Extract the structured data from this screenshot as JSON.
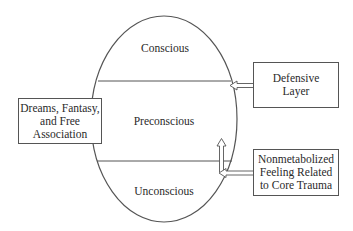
{
  "diagram": {
    "regions": [
      {
        "label": "Conscious"
      },
      {
        "label": "Preconscious"
      },
      {
        "label": "Unconscious"
      }
    ],
    "boxes": {
      "dreams": {
        "lines": [
          "Dreams, Fantasy,",
          "and Free",
          "Association"
        ]
      },
      "defensive": {
        "lines": [
          "Defensive",
          "Layer"
        ]
      },
      "nonmetabolized": {
        "lines": [
          "Nonmetabolized",
          "Feeling Related",
          "to Core Trauma"
        ]
      }
    },
    "colors": {
      "stroke": "#555555",
      "text": "#2a2a2a",
      "background": "#ffffff"
    }
  }
}
